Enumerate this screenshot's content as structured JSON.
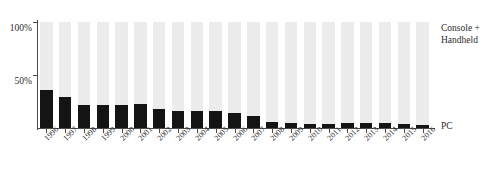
{
  "chart_data": {
    "type": "bar",
    "title": "",
    "subtitle": "",
    "xlabel": "",
    "ylabel": "",
    "ylim": [
      0,
      100
    ],
    "ytick_labels": [
      "50%",
      "100%"
    ],
    "yticks": [
      50,
      100
    ],
    "grid": false,
    "stacked": true,
    "legend_position": "right",
    "categories": [
      "1996",
      "1997",
      "1998",
      "1999",
      "2000",
      "2001",
      "2002",
      "2003",
      "2004",
      "2005",
      "2006",
      "2007",
      "2008",
      "2009",
      "2010",
      "2011",
      "2012",
      "2013",
      "2014",
      "2015",
      "2016"
    ],
    "series": [
      {
        "name": "PC",
        "color": "#141414",
        "values": [
          36,
          29,
          22,
          22,
          22,
          23,
          18,
          16,
          16,
          16,
          14,
          11,
          6,
          5,
          4,
          4,
          5,
          5,
          5,
          4,
          3
        ]
      },
      {
        "name": "Console + Handheld",
        "color": "#ececec",
        "values": [
          64,
          71,
          78,
          78,
          78,
          77,
          82,
          84,
          84,
          84,
          86,
          89,
          94,
          95,
          96,
          96,
          95,
          95,
          95,
          96,
          97
        ]
      }
    ],
    "annotations": {
      "console_label_line1": "Console +",
      "console_label_line2": "Handheld",
      "pc_label": "PC"
    }
  }
}
